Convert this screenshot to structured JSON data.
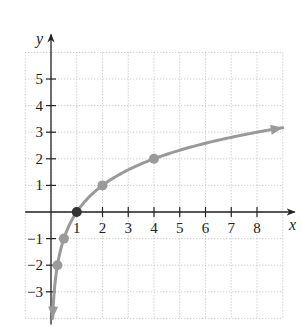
{
  "chart_data": {
    "type": "line",
    "title": "",
    "function": "y = log2(x)",
    "xlabel": "x",
    "ylabel": "y",
    "xlim": [
      -1,
      9
    ],
    "ylim": [
      -4,
      6
    ],
    "grid": true,
    "grid_style": "dotted",
    "x_ticks": [
      1,
      2,
      3,
      4,
      5,
      6,
      7,
      8
    ],
    "y_ticks": [
      -3,
      -2,
      -1,
      1,
      2,
      3,
      4,
      5
    ],
    "series": [
      {
        "name": "y = log2(x)",
        "color": "#9a9a9a",
        "points": [
          {
            "x": 0.25,
            "y": -2
          },
          {
            "x": 0.5,
            "y": -1
          },
          {
            "x": 1,
            "y": 0
          },
          {
            "x": 2,
            "y": 1
          },
          {
            "x": 4,
            "y": 2
          }
        ],
        "arrow_ends": true
      }
    ]
  },
  "layout": {
    "origin_px": [
      51,
      212
    ],
    "unit_x_px": 25.75,
    "unit_y_px": 26.6
  }
}
